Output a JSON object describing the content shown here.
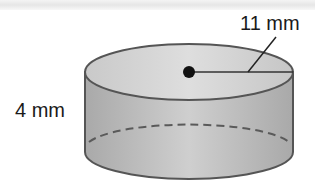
{
  "figure": {
    "type": "cylinder",
    "labels": {
      "radius": "11 mm",
      "height": "4 mm"
    },
    "colors": {
      "side_fill": "#b8b8b8",
      "top_fill": "#d2d2d2",
      "outline": "#555555",
      "center_dot": "#111111",
      "label_text": "#1a1a1a"
    }
  }
}
